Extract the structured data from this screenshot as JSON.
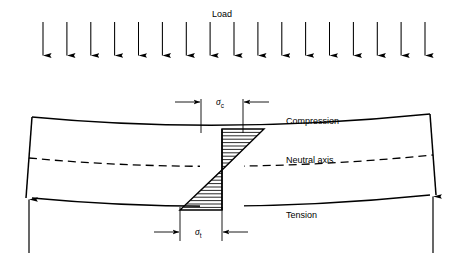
{
  "figure": {
    "background_color": "#ffffff",
    "line_color": "#000000",
    "width": 460,
    "height": 263
  },
  "labels": {
    "load": "Load",
    "compression": "Compression",
    "neutral_axis": "Neutral axis",
    "tension": "Tension",
    "sigma_symbol": "σ",
    "sigma_c_subscript": "c",
    "sigma_t_subscript": "t"
  },
  "load_arrows": {
    "count": 17,
    "x_start": 43,
    "x_end": 425,
    "y_top": 22,
    "y_bottom": 57,
    "description": "uniformly distributed downward load arrows"
  },
  "beam": {
    "left_x": 32,
    "right_x": 430,
    "top_left_y": 117,
    "top_mid_y": 127,
    "bottom_left_y": 198,
    "bottom_mid_y": 208,
    "description": "simply supported beam deflected downward, sagging"
  },
  "supports": {
    "left_reaction_label": "",
    "right_reaction_label": "",
    "left_x": 32,
    "right_x": 430,
    "arrow_y_base": 253
  },
  "stress_block": {
    "center_x": 222,
    "top_y": 129,
    "bottom_y": 210,
    "neutral_y": 170,
    "compression_width": 42,
    "tension_width": 42,
    "hatch_lines": 12,
    "description": "linear bending stress: compression above neutral axis, tension below"
  },
  "dimensions": {
    "sigma_c_label_x": 222,
    "sigma_c_label_y": 104,
    "sigma_t_label_x": 222,
    "sigma_t_label_y": 231,
    "extension_left_x": 201,
    "extension_right_x": 243
  }
}
